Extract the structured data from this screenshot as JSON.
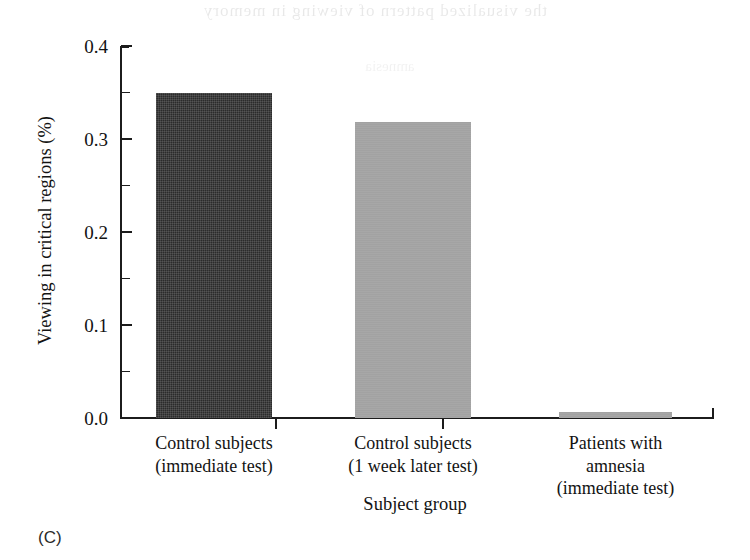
{
  "panel": {
    "letter": "(C)"
  },
  "artifact": {
    "bleed_top": "the visualized pattern of viewing in memory",
    "bleed_mid": "amnesia"
  },
  "chart_data": {
    "type": "bar",
    "title": "",
    "xlabel": "Subject group",
    "ylabel": "Viewing in critical regions (%)",
    "categories": [
      "Control subjects (immediate test)",
      "Control subjects (1 week later test)",
      "Patients with amnesia (immediate test)"
    ],
    "category_lines": [
      [
        "Control subjects",
        "(immediate test)"
      ],
      [
        "Control subjects",
        "(1 week later test)"
      ],
      [
        "Patients with",
        "amnesia",
        "(immediate test)"
      ]
    ],
    "values": [
      0.35,
      0.318,
      0.007
    ],
    "bar_colors": [
      "#2b2b2b",
      "#a2a2a2",
      "#a2a2a2"
    ],
    "ylim": [
      0.0,
      0.4
    ],
    "ytick_labels": [
      "0.0",
      "0.1",
      "0.2",
      "0.3",
      "0.4"
    ],
    "ytick_values": [
      0.0,
      0.1,
      0.2,
      0.3,
      0.4
    ],
    "yminor_values": [
      0.05,
      0.15,
      0.25,
      0.35
    ],
    "grid": false,
    "legend": false
  }
}
